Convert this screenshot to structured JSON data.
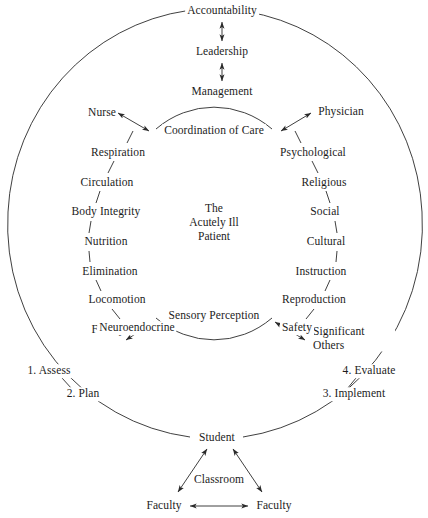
{
  "diagram": {
    "center_label": "The\nAcutely Ill\nPatient",
    "line_color": "#2a2a2a",
    "background_color": "#ffffff",
    "top_chain": {
      "accountability": "Accountability",
      "leadership": "Leadership",
      "management": "Management"
    },
    "inner_arc": {
      "top_label": "Coordination of Care",
      "bottom_label": "Sensory Perception"
    },
    "roles": {
      "nurse": "Nurse",
      "physician": "Physician",
      "family": "Family",
      "significant_others": "Significant\nOthers"
    },
    "left_column": [
      "Respiration",
      "Circulation",
      "Body Integrity",
      "Nutrition",
      "Elimination",
      "Locomotion",
      "Neuroendocrine"
    ],
    "right_column": [
      "Psychological",
      "Religious",
      "Social",
      "Cultural",
      "Instruction",
      "Reproduction",
      "Safety"
    ],
    "process_steps": [
      "1. Assess",
      "2. Plan",
      "3. Implement",
      "4. Evaluate"
    ],
    "bottom": {
      "student": "Student",
      "classroom": "Classroom",
      "faculty_left": "Faculty",
      "faculty_right": "Faculty"
    }
  }
}
